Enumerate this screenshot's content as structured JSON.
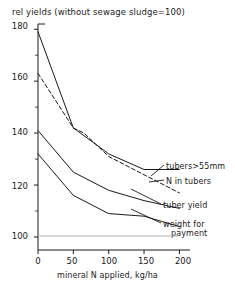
{
  "chart_data": {
    "type": "line",
    "title": "rel yields (without sewage sludge=100)",
    "xlabel": "mineral N applied, kg/ha",
    "ylabel": "",
    "xlim": [
      0,
      215
    ],
    "ylim": [
      95,
      182
    ],
    "xticks": [
      0,
      50,
      100,
      150,
      200
    ],
    "yticks": [
      100,
      120,
      140,
      160,
      180
    ],
    "y_minor_ticks": [
      110,
      130,
      150,
      170
    ],
    "grid": false,
    "legend": "inline-right-labels",
    "reference_line": {
      "y": 100,
      "label": "100",
      "style": "light-solid"
    },
    "series": [
      {
        "name": "tubers>55mm",
        "style": "solid",
        "x": [
          0,
          50,
          65,
          100,
          150,
          200
        ],
        "values": [
          179,
          142,
          139,
          132,
          126,
          126
        ]
      },
      {
        "name": "N in tubers",
        "style": "dashed",
        "x": [
          0,
          50,
          65,
          100,
          150,
          200
        ],
        "values": [
          163,
          142,
          140,
          131,
          124,
          117
        ]
      },
      {
        "name": "tuber yield",
        "style": "solid",
        "x": [
          0,
          50,
          100,
          150,
          200
        ],
        "values": [
          141,
          125,
          118,
          114,
          111
        ]
      },
      {
        "name": "weight for payment",
        "style": "solid",
        "x": [
          0,
          50,
          100,
          150,
          200
        ],
        "values": [
          132,
          116,
          109,
          108,
          104
        ]
      }
    ]
  },
  "labels": {
    "tubers55": "tubers>55mm",
    "n_in_tubers": "N in tubers",
    "tuber_yield": "tuber yield",
    "weight_for_1": "weight for",
    "weight_for_2": "payment"
  },
  "axis": {
    "y": {
      "t180": "180",
      "t160": "160",
      "t140": "140",
      "t120": "120",
      "t100": "100"
    },
    "x": {
      "t0": "0",
      "t50": "50",
      "t100": "100",
      "t150": "150",
      "t200": "200"
    }
  },
  "colors": {
    "ink": "#1a1a1a",
    "background": "#ffffff",
    "reference_line": "#b5b5b5"
  }
}
